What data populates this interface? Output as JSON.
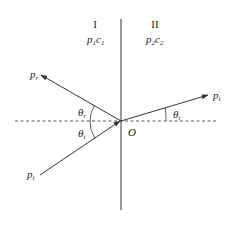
{
  "diagram": {
    "type": "wave-reflection-transmission",
    "colors": {
      "line": "#333333",
      "background": "#ffffff"
    },
    "media": [
      {
        "id": "I",
        "label": "I",
        "impedance_base": "p",
        "impedance_sub": "1",
        "speed_base": "c",
        "speed_sub": "1"
      },
      {
        "id": "II",
        "label": "II",
        "impedance_base": "p",
        "impedance_sub": "2",
        "speed_base": "c",
        "speed_sub": "2"
      }
    ],
    "origin_label": "O",
    "rays": {
      "incident": {
        "base": "p",
        "sub": "i"
      },
      "reflected": {
        "base": "p",
        "sub": "r"
      },
      "transmitted": {
        "base": "p",
        "sub": "t"
      }
    },
    "angles": {
      "incident": {
        "base": "θ",
        "sub": "i"
      },
      "reflected": {
        "base": "θ",
        "sub": "r"
      },
      "transmitted": {
        "base": "θ",
        "sub": "t"
      }
    }
  }
}
